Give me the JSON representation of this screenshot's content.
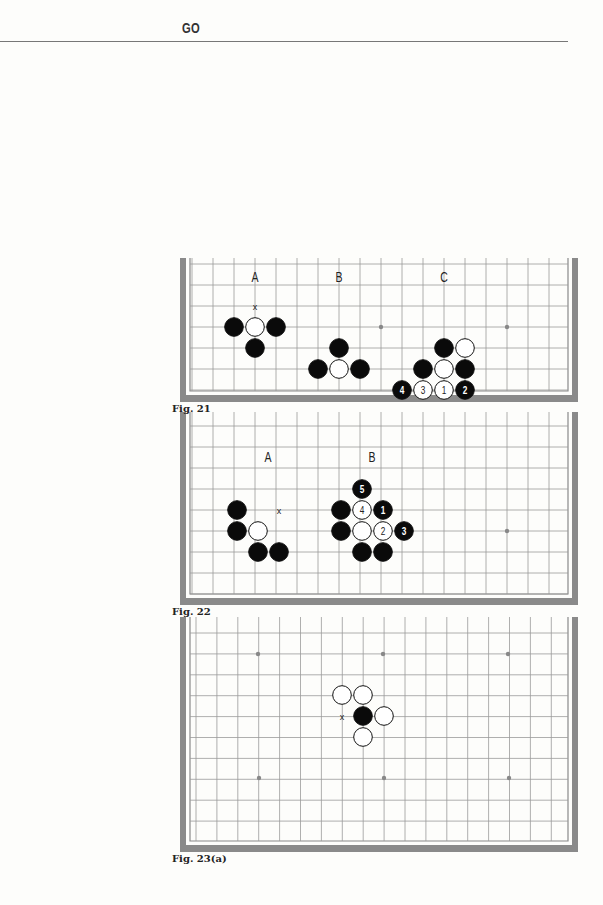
{
  "header": {
    "title": "GO"
  },
  "figures": [
    {
      "id": "fig21",
      "caption": "Fig. 21",
      "board": {
        "x": 180,
        "y": 258,
        "w": 398,
        "h": 144,
        "open_top": true,
        "grid": {
          "x0": 192,
          "y0": 264,
          "cols": 19,
          "rows": 7,
          "step": 21,
          "bottom_edge": true
        },
        "hoshi": [
          [
            381,
            327
          ],
          [
            507,
            327
          ]
        ]
      },
      "labels": [
        {
          "text": "A",
          "x": 255,
          "y": 282
        },
        {
          "text": "B",
          "x": 339,
          "y": 282
        },
        {
          "text": "C",
          "x": 444,
          "y": 282
        }
      ],
      "marks": [
        {
          "text": "x",
          "x": 255,
          "y": 306
        }
      ],
      "stones": [
        {
          "c": "b",
          "x": 234,
          "y": 327
        },
        {
          "c": "w",
          "x": 255,
          "y": 327
        },
        {
          "c": "b",
          "x": 276,
          "y": 327
        },
        {
          "c": "b",
          "x": 255,
          "y": 348
        },
        {
          "c": "b",
          "x": 339,
          "y": 348
        },
        {
          "c": "b",
          "x": 318,
          "y": 369
        },
        {
          "c": "w",
          "x": 339,
          "y": 369
        },
        {
          "c": "b",
          "x": 360,
          "y": 369
        },
        {
          "c": "b",
          "x": 444,
          "y": 348
        },
        {
          "c": "w",
          "x": 465,
          "y": 348
        },
        {
          "c": "b",
          "x": 423,
          "y": 369
        },
        {
          "c": "w",
          "x": 444,
          "y": 369
        },
        {
          "c": "b",
          "x": 465,
          "y": 369
        },
        {
          "c": "b",
          "x": 402,
          "y": 390,
          "n": "4"
        },
        {
          "c": "w",
          "x": 423,
          "y": 390,
          "n": "3"
        },
        {
          "c": "w",
          "x": 444,
          "y": 390,
          "n": "1"
        },
        {
          "c": "b",
          "x": 465,
          "y": 390,
          "n": "2"
        }
      ]
    },
    {
      "id": "fig22",
      "caption": "Fig. 22",
      "board": {
        "x": 180,
        "y": 412,
        "w": 398,
        "h": 193,
        "open_top": true,
        "grid": {
          "x0": 192,
          "y0": 426,
          "cols": 19,
          "rows": 9,
          "step": 21,
          "bottom_edge": true
        },
        "hoshi": [
          [
            507,
            531
          ]
        ]
      },
      "labels": [
        {
          "text": "A",
          "x": 268,
          "y": 462
        },
        {
          "text": "B",
          "x": 372,
          "y": 462
        }
      ],
      "marks": [
        {
          "text": "x",
          "x": 279,
          "y": 510
        }
      ],
      "stones": [
        {
          "c": "b",
          "x": 237,
          "y": 510
        },
        {
          "c": "b",
          "x": 237,
          "y": 531
        },
        {
          "c": "w",
          "x": 258,
          "y": 531
        },
        {
          "c": "b",
          "x": 258,
          "y": 552
        },
        {
          "c": "b",
          "x": 279,
          "y": 552
        },
        {
          "c": "b",
          "x": 362,
          "y": 489,
          "n": "5"
        },
        {
          "c": "b",
          "x": 341,
          "y": 510
        },
        {
          "c": "w",
          "x": 362,
          "y": 510,
          "n": "4"
        },
        {
          "c": "b",
          "x": 383,
          "y": 510,
          "n": "1"
        },
        {
          "c": "b",
          "x": 341,
          "y": 531
        },
        {
          "c": "w",
          "x": 362,
          "y": 531
        },
        {
          "c": "w",
          "x": 383,
          "y": 531,
          "n": "2"
        },
        {
          "c": "b",
          "x": 404,
          "y": 531,
          "n": "3"
        },
        {
          "c": "b",
          "x": 362,
          "y": 552
        },
        {
          "c": "b",
          "x": 383,
          "y": 552
        }
      ]
    },
    {
      "id": "fig23a",
      "caption": "Fig. 23(a)",
      "board": {
        "x": 180,
        "y": 617,
        "w": 398,
        "h": 235,
        "open_top": true,
        "grid": {
          "x0": 196,
          "y0": 633,
          "cols": 19,
          "rows": 11,
          "step": 20.9,
          "bottom_edge": true
        },
        "hoshi": [
          [
            258,
            654
          ],
          [
            383,
            654
          ],
          [
            508,
            654
          ],
          [
            259,
            778
          ],
          [
            384,
            778
          ],
          [
            509,
            778
          ]
        ]
      },
      "labels": [],
      "marks": [
        {
          "text": "x",
          "x": 342,
          "y": 716
        }
      ],
      "stones": [
        {
          "c": "w",
          "x": 342,
          "y": 695
        },
        {
          "c": "w",
          "x": 363,
          "y": 695
        },
        {
          "c": "b",
          "x": 363,
          "y": 716
        },
        {
          "c": "w",
          "x": 384,
          "y": 716
        },
        {
          "c": "w",
          "x": 363,
          "y": 737
        }
      ]
    }
  ],
  "colors": {
    "border": "#8a8a8a",
    "grid": "#9a9a9a",
    "stone_black": "#0a0a0a",
    "stone_white": "#ffffff",
    "hoshi": "#888888"
  }
}
